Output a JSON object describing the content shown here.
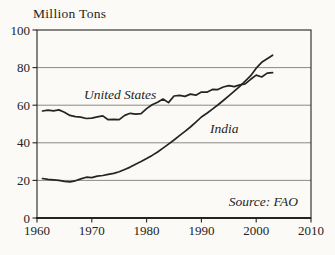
{
  "figure": {
    "background": "#fbfaf6",
    "ink": "#242424",
    "grid_color": "#7d7d7d"
  },
  "chart_data": {
    "type": "line",
    "title": "Million Tons",
    "source_note": "Source: FAO",
    "xlabel": "",
    "ylabel": "Million Tons",
    "xlim": [
      1960,
      2010
    ],
    "ylim": [
      0,
      100
    ],
    "x_ticks": [
      1960,
      1970,
      1980,
      1990,
      2000,
      2010
    ],
    "y_ticks": [
      0,
      20,
      40,
      60,
      80,
      100
    ],
    "grid": "horizontal",
    "legend_position": "inline-annotations",
    "years": [
      1961,
      1962,
      1963,
      1964,
      1965,
      1966,
      1967,
      1968,
      1969,
      1970,
      1971,
      1972,
      1973,
      1974,
      1975,
      1976,
      1977,
      1978,
      1979,
      1980,
      1981,
      1982,
      1983,
      1984,
      1985,
      1986,
      1987,
      1988,
      1989,
      1990,
      1991,
      1992,
      1993,
      1994,
      1995,
      1996,
      1997,
      1998,
      1999,
      2000,
      2001,
      2002,
      2003
    ],
    "series": [
      {
        "name": "United States",
        "values": [
          56.9,
          57.4,
          57.0,
          57.5,
          56.3,
          54.6,
          53.9,
          53.6,
          52.9,
          53.1,
          53.8,
          54.3,
          52.3,
          52.5,
          52.3,
          54.6,
          55.7,
          55.2,
          55.5,
          58.2,
          60.2,
          61.6,
          63.3,
          61.4,
          64.9,
          65.2,
          64.7,
          65.9,
          65.3,
          67.0,
          66.9,
          68.4,
          68.3,
          69.7,
          70.4,
          69.9,
          70.8,
          71.4,
          73.8,
          76.0,
          75.0,
          77.1,
          77.3
        ]
      },
      {
        "name": "India",
        "values": [
          21.0,
          20.6,
          20.3,
          20.0,
          19.5,
          19.2,
          19.8,
          20.8,
          21.7,
          21.5,
          22.3,
          22.6,
          23.2,
          23.7,
          24.6,
          25.8,
          27.1,
          28.6,
          30.0,
          31.6,
          33.3,
          35.1,
          37.2,
          39.3,
          41.5,
          43.8,
          46.1,
          48.4,
          51.0,
          53.7,
          55.7,
          57.9,
          60.1,
          62.5,
          65.0,
          67.5,
          70.0,
          72.8,
          75.7,
          79.7,
          82.8,
          84.7,
          86.6
        ]
      }
    ]
  }
}
